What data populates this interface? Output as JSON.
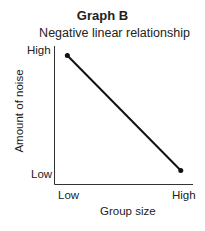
{
  "chart_data": {
    "type": "line",
    "title": "Graph B",
    "subtitle": "Negative linear relationship",
    "xlabel": "Group size",
    "ylabel": "Amount of noise",
    "x_tick_labels": [
      "Low",
      "High"
    ],
    "y_tick_labels": [
      "Low",
      "High"
    ],
    "series": [
      {
        "name": "Negative linear relationship",
        "points": [
          {
            "x": "Low",
            "y": "High"
          },
          {
            "x": "High",
            "y": "Low"
          }
        ],
        "x": [
          0.1,
          0.95
        ],
        "y": [
          0.95,
          0.1
        ]
      }
    ],
    "xlim": [
      0,
      1
    ],
    "ylim": [
      0,
      1
    ],
    "grid": false,
    "legend": "none"
  }
}
